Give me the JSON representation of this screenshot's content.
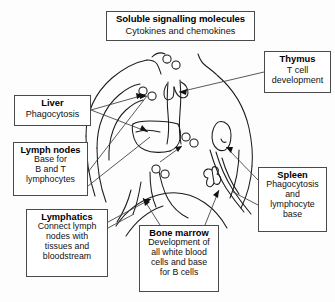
{
  "diagram": {
    "callouts": [
      {
        "id": "soluble",
        "name": "soluble-signalling-molecules",
        "title": "Soluble signalling molecules",
        "subtitle": "Cytokines and chemokines"
      },
      {
        "id": "thymus",
        "name": "thymus",
        "title": "Thymus",
        "subtitle": "T cell\ndevelopment"
      },
      {
        "id": "liver",
        "name": "liver",
        "title": "Liver",
        "subtitle": "Phagocytosis"
      },
      {
        "id": "lymph_nodes",
        "name": "lymph-nodes",
        "title": "Lymph nodes",
        "subtitle": "Base for\nB and T\nlymphocytes"
      },
      {
        "id": "lymphatics",
        "name": "lymphatics",
        "title": "Lymphatics",
        "subtitle": "Connect lymph\nnodes with\ntissues and\nbloodstream"
      },
      {
        "id": "bone_marrow",
        "name": "bone-marrow",
        "title": "Bone marrow",
        "subtitle": "Development of\nall white blood\ncells and base\nfor B cells"
      },
      {
        "id": "spleen",
        "name": "spleen",
        "title": "Spleen",
        "subtitle": "Phagocytosis\nand\nlymphocyte\nbase"
      }
    ],
    "colors": {
      "background": "#fdfdfd",
      "line": "#1b1b1b",
      "box_border": "#4a4a4a",
      "leader": "#3a3a3a",
      "text": "#000000"
    },
    "graphic_elements": {
      "body_outline": "line-drawing of human head, neck, shoulders, thorax and abdomen",
      "cell_clusters": 4,
      "arrow_count": 7,
      "organs_depicted": [
        "thymus",
        "liver",
        "lymph nodes",
        "lymphatic vessels",
        "bone (femur/pelvis)",
        "spleen"
      ]
    }
  }
}
